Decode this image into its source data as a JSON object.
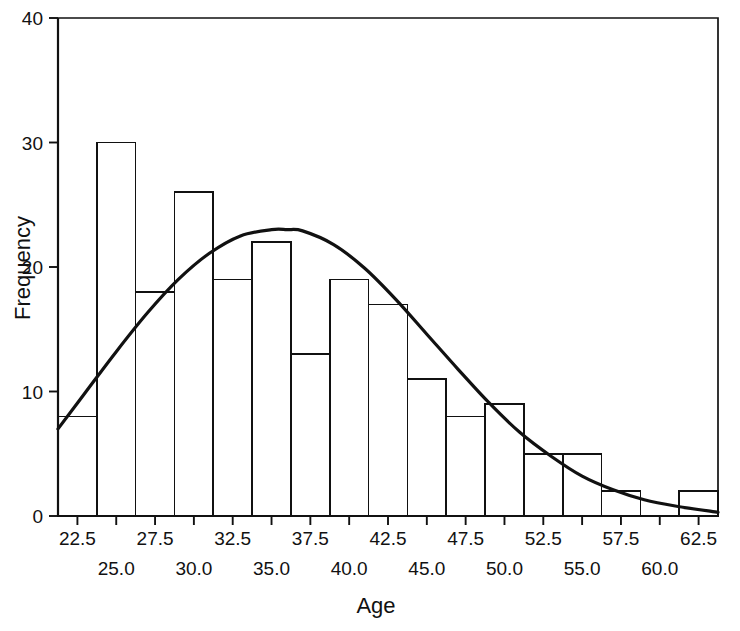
{
  "chart_data": {
    "type": "bar",
    "title": "",
    "xlabel": "Age",
    "ylabel": "Frequency",
    "xlim": [
      21.25,
      63.75
    ],
    "ylim": [
      0,
      40
    ],
    "grid": false,
    "legend": null,
    "bin_width": 2.5,
    "bin_starts": [
      21.25,
      23.75,
      26.25,
      28.75,
      31.25,
      33.75,
      36.25,
      38.75,
      41.25,
      43.75,
      46.25,
      48.75,
      51.25,
      53.75,
      56.25,
      58.75,
      61.25
    ],
    "bin_centers": [
      22.5,
      25.0,
      27.5,
      30.0,
      32.5,
      35.0,
      37.5,
      40.0,
      42.5,
      45.0,
      47.5,
      50.0,
      52.5,
      55.0,
      57.5,
      60.0,
      62.5
    ],
    "categories": [
      "22.5",
      "25.0",
      "27.5",
      "30.0",
      "32.5",
      "35.0",
      "37.5",
      "40.0",
      "42.5",
      "45.0",
      "47.5",
      "50.0",
      "52.5",
      "55.0",
      "57.5",
      "60.0",
      "62.5"
    ],
    "values": [
      8,
      30,
      18,
      26,
      19,
      22,
      13,
      19,
      17,
      11,
      8,
      9,
      5,
      5,
      2,
      0,
      2
    ],
    "y_ticks": [
      0,
      10,
      20,
      30,
      40
    ],
    "y_tick_labels": [
      "0",
      "10",
      "20",
      "30",
      "40"
    ],
    "x_tick_labels_row1": [
      "22.5",
      "27.5",
      "32.5",
      "37.5",
      "42.5",
      "47.5",
      "52.5",
      "57.5",
      "62.5"
    ],
    "x_tick_values_row1": [
      22.5,
      27.5,
      32.5,
      37.5,
      42.5,
      47.5,
      52.5,
      57.5,
      62.5
    ],
    "x_tick_labels_row2": [
      "25.0",
      "30.0",
      "35.0",
      "40.0",
      "45.0",
      "50.0",
      "55.0",
      "60.0"
    ],
    "x_tick_values_row2": [
      25.0,
      30.0,
      35.0,
      40.0,
      45.0,
      50.0,
      55.0,
      60.0
    ],
    "overlay_curve": {
      "name": "normal-distribution-curve",
      "type": "line",
      "mean": 36.0,
      "std_dev": 8.6,
      "peak_value": 23,
      "peak_x": 36.0,
      "x": [
        21.25,
        23.0,
        25.0,
        27.0,
        29.0,
        31.0,
        33.0,
        35.0,
        36.0,
        37.0,
        39.0,
        41.0,
        43.0,
        45.0,
        47.0,
        49.0,
        51.0,
        53.0,
        55.0,
        57.0,
        59.0,
        61.0,
        63.75
      ],
      "y": [
        7.0,
        9.9,
        13.2,
        16.3,
        19.0,
        21.1,
        22.5,
        23.0,
        23.0,
        22.9,
        21.8,
        19.9,
        17.4,
        14.6,
        11.8,
        9.1,
        6.7,
        4.8,
        3.2,
        2.1,
        1.3,
        0.8,
        0.3
      ]
    }
  },
  "axes": {
    "y_title": "Frequency",
    "x_title": "Age"
  },
  "colors": {
    "ink": "#111111",
    "background": "#ffffff",
    "bar_fill": "none",
    "curve": "#111111"
  }
}
